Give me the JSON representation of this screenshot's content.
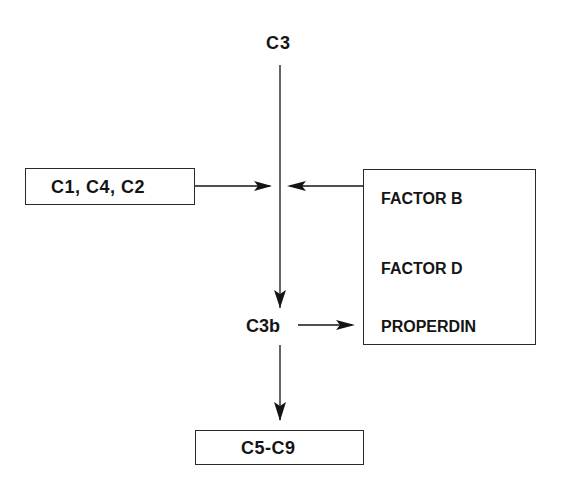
{
  "diagram": {
    "nodes": {
      "c3": {
        "label": "C3"
      },
      "classical": {
        "label": "C1, C4, C2"
      },
      "c3b": {
        "label": "C3b"
      },
      "alternative": {
        "items": [
          "FACTOR B",
          "FACTOR D",
          "PROPERDIN"
        ]
      },
      "terminal": {
        "label": "C5-C9"
      }
    },
    "edges": [
      {
        "from": "c3",
        "to": "c3b",
        "type": "arrow"
      },
      {
        "from": "classical",
        "to": "c3-conversion",
        "type": "arrow"
      },
      {
        "from": "alternative",
        "to": "c3-conversion",
        "type": "arrow"
      },
      {
        "from": "c3b",
        "to": "alternative",
        "type": "arrow"
      },
      {
        "from": "c3b",
        "to": "terminal",
        "type": "arrow"
      }
    ],
    "colors": {
      "ink": "#141414",
      "background": "#ffffff"
    }
  }
}
